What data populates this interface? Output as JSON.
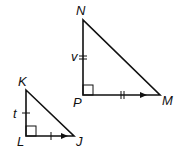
{
  "diagram": {
    "large_triangle": {
      "vertices": {
        "N": "N",
        "P": "P",
        "M": "M"
      },
      "side_label": "v",
      "right_angle_at": "P"
    },
    "small_triangle": {
      "vertices": {
        "K": "K",
        "L": "L",
        "J": "J"
      },
      "side_label": "t",
      "right_angle_at": "L"
    },
    "colors": {
      "stroke": "#111111",
      "background": "#ffffff"
    }
  }
}
